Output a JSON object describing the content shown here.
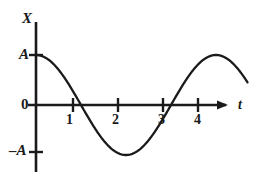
{
  "figure": {
    "background_color": "#ffffff",
    "ink_color": "#1a1a1a"
  },
  "axes": {
    "y_axis_label": "X",
    "x_axis_label": "t",
    "origin_label": "0",
    "y_tick_top_label": "A",
    "y_tick_bottom_label": "–A",
    "x_tick_labels": [
      "1",
      "2",
      "3",
      "4"
    ]
  },
  "chart_data": {
    "type": "line",
    "title": "",
    "xlabel": "t",
    "ylabel": "X",
    "grid": false,
    "legend": false,
    "waveform": "cosine",
    "amplitude_label": "A",
    "amplitude": 1,
    "period": 4,
    "phase": 0,
    "equation": "X = A cos(2πt/4)",
    "xlim": [
      0,
      4.75
    ],
    "ylim": [
      -1.35,
      1.35
    ],
    "ytick_values": [
      1,
      0,
      -1
    ],
    "ytick_labels": [
      "A",
      "0",
      "–A"
    ],
    "xtick_values": [
      1,
      2,
      3,
      4
    ],
    "xtick_labels": [
      "1",
      "2",
      "3",
      "4"
    ],
    "key_points": [
      {
        "t": 0,
        "X": 1,
        "note": "starts at +A"
      },
      {
        "t": 1,
        "X": 0,
        "note": "zero crossing, descending"
      },
      {
        "t": 2,
        "X": -1,
        "note": "minimum at –A"
      },
      {
        "t": 3,
        "X": 0,
        "note": "zero crossing, ascending"
      },
      {
        "t": 4,
        "X": 1,
        "note": "maximum at +A"
      },
      {
        "t": 4.7,
        "X": -0.45,
        "note": "curve continues downward past arrow"
      }
    ],
    "x": [
      0,
      0.25,
      0.5,
      0.75,
      1,
      1.25,
      1.5,
      1.75,
      2,
      2.25,
      2.5,
      2.75,
      3,
      3.25,
      3.5,
      3.75,
      4,
      4.25,
      4.5,
      4.7
    ],
    "values": [
      1,
      0.924,
      0.707,
      0.383,
      0,
      -0.383,
      -0.707,
      -0.924,
      -1,
      -0.924,
      -0.707,
      -0.383,
      0,
      0.383,
      0.707,
      0.924,
      1,
      0.707,
      0.383,
      -0.454
    ]
  }
}
